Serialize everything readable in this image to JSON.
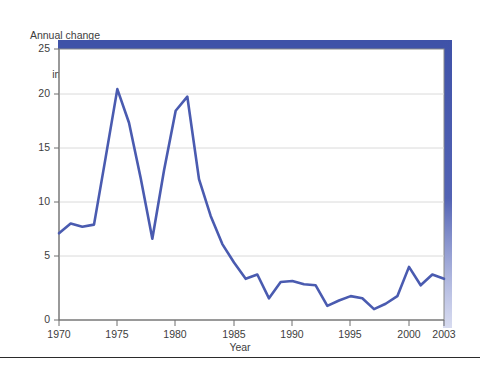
{
  "figure": {
    "name": "annual-change-in-cpi-line-chart",
    "background_color": "#ffffff",
    "line_color": "#4a5bb0",
    "frame_color": "#3f52a8",
    "grid_color": "#d9d9d9",
    "axis_color": "#7a7a7a",
    "text_color": "#3d3d3d"
  },
  "labels": {
    "ylabel_line1": "Annual change",
    "ylabel_line2": "in CPI (%)",
    "xlabel": "Year"
  },
  "chart_data": {
    "type": "line",
    "title": "",
    "subtitle": "",
    "xlabel": "Year",
    "ylabel": "Annual change in CPI (%)",
    "xlim": [
      1970,
      2003
    ],
    "ylim": [
      0,
      25
    ],
    "xticks": [
      1970,
      1975,
      1980,
      1985,
      1990,
      1995,
      2000,
      2003
    ],
    "xtick_labels": [
      "1970",
      "1975",
      "1980",
      "1985",
      "1990",
      "1995",
      "2000",
      "2003"
    ],
    "yticks": [
      0,
      5,
      10,
      15,
      20,
      25
    ],
    "ytick_labels": [
      "0",
      "5",
      "10",
      "15",
      "20",
      "25"
    ],
    "grid": "horizontal",
    "legend": "none",
    "series": [
      {
        "name": "Annual change in CPI (%)",
        "color": "#4a5bb0",
        "x": [
          1970,
          1971,
          1972,
          1973,
          1974,
          1975,
          1976,
          1977,
          1978,
          1979,
          1980,
          1981,
          1982,
          1983,
          1984,
          1985,
          1986,
          1987,
          1988,
          1989,
          1990,
          1991,
          1992,
          1993,
          1994,
          1995,
          1996,
          1997,
          1998,
          1999,
          2000,
          2001,
          2002,
          2003
        ],
        "y": [
          8.0,
          8.9,
          8.6,
          8.8,
          15.0,
          21.3,
          18.2,
          13.1,
          7.5,
          13.8,
          19.3,
          20.6,
          13.0,
          9.6,
          7.0,
          5.3,
          3.8,
          4.2,
          2.0,
          3.5,
          3.6,
          3.3,
          3.2,
          1.3,
          1.8,
          2.2,
          2.0,
          1.0,
          1.5,
          2.2,
          4.9,
          3.2,
          4.2,
          3.8
        ]
      }
    ]
  }
}
